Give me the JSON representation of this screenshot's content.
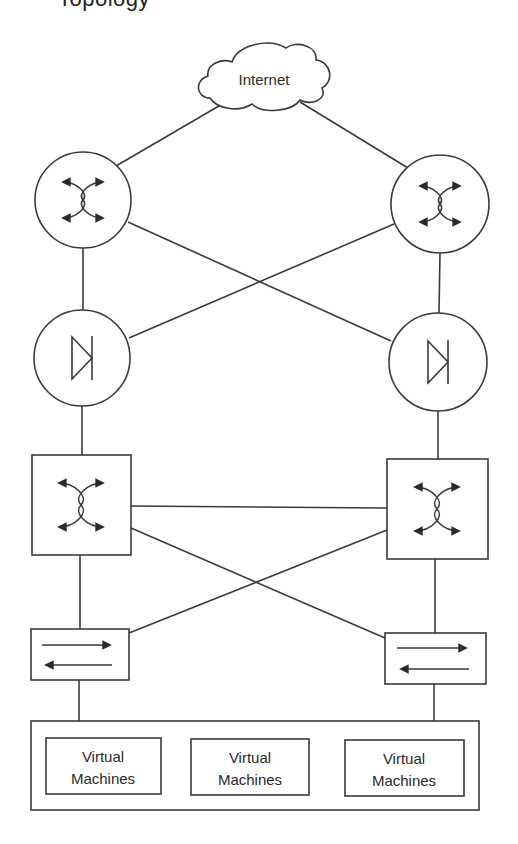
{
  "title_fragment": "Topology",
  "diagram": {
    "type": "network-topology",
    "colors": {
      "line": "#3a3a3a",
      "background": "#ffffff",
      "text": "#2a2a2a"
    },
    "cloud": {
      "id": "internet",
      "label": "Internet",
      "icon": "cloud-icon"
    },
    "nodes": [
      {
        "id": "router-left",
        "kind": "router",
        "shape": "circle",
        "icon": "router-icon",
        "cx": 83,
        "cy": 200,
        "r": 48
      },
      {
        "id": "router-right",
        "kind": "router",
        "shape": "circle",
        "icon": "router-icon",
        "cx": 440,
        "cy": 204,
        "r": 49
      },
      {
        "id": "firewall-left",
        "kind": "firewall",
        "shape": "circle",
        "icon": "diode-icon",
        "cx": 82,
        "cy": 358,
        "r": 48
      },
      {
        "id": "firewall-right",
        "kind": "firewall",
        "shape": "circle",
        "icon": "diode-icon",
        "cx": 438,
        "cy": 362,
        "r": 49
      },
      {
        "id": "switch-left",
        "kind": "switch",
        "shape": "square",
        "icon": "switch-icon",
        "x": 32,
        "y": 455,
        "w": 99,
        "h": 100
      },
      {
        "id": "switch-right",
        "kind": "switch",
        "shape": "square",
        "icon": "switch-icon",
        "x": 387,
        "y": 459,
        "w": 101,
        "h": 100
      },
      {
        "id": "lb-left",
        "kind": "load-balancer",
        "shape": "rect",
        "icon": "bidirectional-arrows-icon",
        "x": 31,
        "y": 629,
        "w": 98,
        "h": 51
      },
      {
        "id": "lb-right",
        "kind": "load-balancer",
        "shape": "rect",
        "icon": "bidirectional-arrows-icon",
        "x": 385,
        "y": 633,
        "w": 101,
        "h": 51
      }
    ],
    "vm_group": {
      "id": "vm-container",
      "x": 31,
      "y": 721,
      "w": 448,
      "h": 89,
      "items": [
        {
          "line1": "Virtual",
          "line2": "Machines",
          "x": 46,
          "y": 738,
          "w": 115,
          "h": 56
        },
        {
          "line1": "Virtual",
          "line2": "Machines",
          "x": 191,
          "y": 739,
          "w": 118,
          "h": 56
        },
        {
          "line1": "Virtual",
          "line2": "Machines",
          "x": 345,
          "y": 740,
          "w": 119,
          "h": 56
        }
      ]
    },
    "links": [
      [
        "internet",
        "router-left"
      ],
      [
        "internet",
        "router-right"
      ],
      [
        "router-left",
        "firewall-left"
      ],
      [
        "router-right",
        "firewall-right"
      ],
      [
        "router-left",
        "firewall-right"
      ],
      [
        "router-right",
        "firewall-left"
      ],
      [
        "firewall-left",
        "switch-left"
      ],
      [
        "firewall-right",
        "switch-right"
      ],
      [
        "switch-left",
        "switch-right"
      ],
      [
        "switch-left",
        "lb-right"
      ],
      [
        "switch-right",
        "lb-left"
      ],
      [
        "switch-left",
        "lb-left"
      ],
      [
        "switch-right",
        "lb-right"
      ],
      [
        "lb-left",
        "vm-container"
      ],
      [
        "lb-right",
        "vm-container"
      ]
    ]
  }
}
